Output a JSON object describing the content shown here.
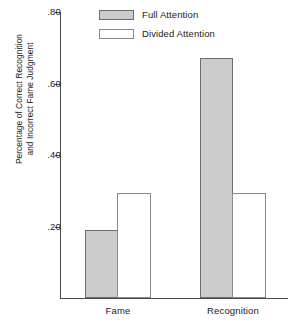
{
  "chart_data": {
    "type": "bar",
    "title": "",
    "xlabel": "",
    "ylabel_line1": "Percentage of Correct Recognition",
    "ylabel_line2": "and Incorrect Fame Judgment",
    "categories": [
      "Fame",
      "Recognition"
    ],
    "series": [
      {
        "name": "Full Attention",
        "values": [
          0.19,
          0.67
        ],
        "color": "#cccccc"
      },
      {
        "name": "Divided Attention",
        "values": [
          0.295,
          0.295
        ],
        "color": "#ffffff"
      }
    ],
    "ylim": [
      0.0,
      0.8
    ],
    "yticks": [
      0.2,
      0.4,
      0.6,
      0.8
    ],
    "ytick_labels": [
      ".20",
      ".40",
      ".60",
      ".80"
    ],
    "grid": false,
    "legend_position": "top-center"
  },
  "legend": {
    "items": [
      {
        "label": "Full Attention"
      },
      {
        "label": "Divided Attention"
      }
    ]
  },
  "axes": {
    "y": {
      "labels": [
        ".80",
        ".60",
        ".40",
        ".20"
      ]
    },
    "x": {
      "labels": [
        "Fame",
        "Recognition"
      ]
    }
  }
}
